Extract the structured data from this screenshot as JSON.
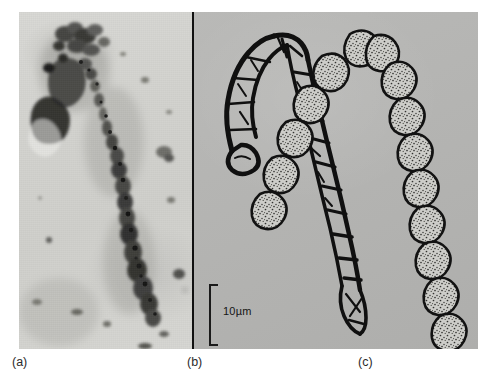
{
  "figure": {
    "name": "three-panel-microbial-filament-figure",
    "background_color": "#ffffff",
    "plate_background_color": "#b6b6b4",
    "divider_color": "#111111",
    "panels": [
      {
        "id": "a",
        "caption": "(a)",
        "type": "photomicrograph",
        "description": "light-field micrograph of a dark-stained segmented filament",
        "background_color": "#d4d4d0"
      },
      {
        "id": "b",
        "caption": "(b)",
        "type": "line-drawing",
        "description": "ink outline drawing of a hairpin-bent multicellular filament with cross walls",
        "background_color": "#b5b5b3"
      },
      {
        "id": "c",
        "caption": "(c)",
        "type": "stippled-drawing",
        "description": "stippled drawing of a V-shaped chain of barrel-shaped cells",
        "background_color": "#b5b5b3"
      }
    ],
    "scale_bar": {
      "label": "10µm",
      "value": 10,
      "unit": "µm",
      "style": "bracket",
      "color": "#1a1a1a"
    }
  }
}
